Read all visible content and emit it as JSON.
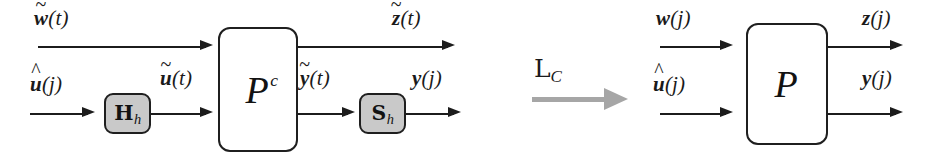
{
  "figure": {
    "colors": {
      "stroke": "#1c1c1c",
      "block_fill": "#ffffff",
      "shaded_block_fill": "#c9c9c9",
      "transform_arrow": "#a6a6a6",
      "background": "#ffffff"
    }
  },
  "left_diagram": {
    "name": "continuous-time sampled-data system",
    "plant_block": {
      "symbol": "P",
      "superscript": "c",
      "full": "P^c"
    },
    "hold_block": {
      "symbol": "H",
      "subscript": "h",
      "full": "H_h"
    },
    "sampler_block": {
      "symbol": "S",
      "subscript": "h",
      "full": "S_h"
    },
    "signals": {
      "input_top": {
        "base": "w",
        "accent": "tilde",
        "arg": "(t)",
        "full": "w̃(t)"
      },
      "input_bottom": {
        "base": "u",
        "accent": "hat",
        "arg": "(j)",
        "full": "û(j)"
      },
      "hold_output": {
        "base": "u",
        "accent": "tilde",
        "arg": "(t)",
        "full": "ũ(t)"
      },
      "plant_output_top": {
        "base": "z",
        "accent": "tilde",
        "arg": "(t)",
        "full": "z̃(t)"
      },
      "plant_output_bottom": {
        "base": "y",
        "accent": "tilde",
        "arg": "(t)",
        "full": "ỹ(t)"
      },
      "output_bottom": {
        "base": "y",
        "accent": "none",
        "arg": "(j)",
        "full": "y(j)"
      }
    }
  },
  "transform": {
    "operator": "L",
    "subscript": "C",
    "full": "L_C",
    "arrow_direction": "right"
  },
  "right_diagram": {
    "name": "lifted discrete-time system",
    "plant_block": {
      "symbol": "P",
      "superscript": "",
      "full": "P"
    },
    "signals": {
      "input_top": {
        "base": "w",
        "accent": "none",
        "arg": "(j)",
        "full": "w(j)"
      },
      "input_bottom": {
        "base": "u",
        "accent": "hat",
        "arg": "(j)",
        "full": "û(j)"
      },
      "output_top": {
        "base": "z",
        "accent": "none",
        "arg": "(j)",
        "full": "z(j)"
      },
      "output_bottom": {
        "base": "y",
        "accent": "none",
        "arg": "(j)",
        "full": "y(j)"
      }
    }
  }
}
